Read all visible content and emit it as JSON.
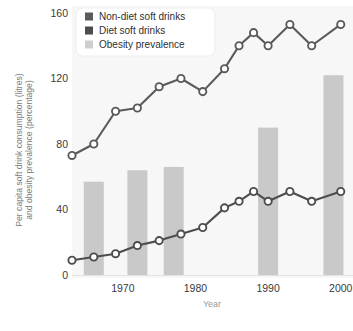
{
  "chart_data": {
    "type": "line",
    "title": "",
    "xlabel": "Year",
    "ylabel": "Per capita soft drink consumption (litres) and obesity prevalence (percentage)",
    "ylabel_line1": "Per capita soft drink consumption (litres)",
    "ylabel_line2": "and obesity prevalence (percentage)",
    "xlim": [
      1963,
      2001
    ],
    "ylim": [
      0,
      160
    ],
    "yticks": [
      0,
      40,
      80,
      120,
      160
    ],
    "ytick_labels": [
      "0",
      "40",
      "80",
      "120",
      "160"
    ],
    "xticks": [
      1970,
      1980,
      1990,
      2000
    ],
    "xtick_labels": [
      "1970",
      "1980",
      "1990",
      "2000"
    ],
    "grid": false,
    "legend_position": "top-left",
    "legend": [
      {
        "label": "Non-diet soft drinks",
        "color": "#5a5a5a",
        "marker": "square"
      },
      {
        "label": "Diet soft drinks",
        "color": "#4d4d4d",
        "marker": "square"
      },
      {
        "label": "Obesity prevalence",
        "color": "#cfcfcf",
        "marker": "square"
      }
    ],
    "series": [
      {
        "name": "Non-diet soft drinks",
        "type": "line",
        "color": "#5a5a5a",
        "marker": "circle-open",
        "x": [
          1963,
          1966,
          1969,
          1972,
          1975,
          1978,
          1981,
          1984,
          1986,
          1988,
          1990,
          1993,
          1996,
          2000
        ],
        "values": [
          73,
          80,
          100,
          102,
          115,
          120,
          112,
          126,
          140,
          148,
          140,
          153,
          140,
          153
        ],
        "y": [
          73,
          80,
          100,
          102,
          115,
          120,
          112,
          126,
          140,
          148,
          140,
          153,
          140,
          153
        ]
      },
      {
        "name": "Diet soft drinks",
        "type": "line",
        "color": "#4d4d4d",
        "marker": "circle-open",
        "x": [
          1963,
          1966,
          1969,
          1972,
          1975,
          1978,
          1981,
          1984,
          1986,
          1988,
          1990,
          1993,
          1996,
          2000
        ],
        "values": [
          9,
          11,
          13,
          18,
          21,
          25,
          29,
          41,
          45,
          51,
          45,
          51,
          45,
          51
        ],
        "y": [
          9,
          11,
          13,
          18,
          21,
          25,
          29,
          41,
          45,
          51,
          45,
          51,
          45,
          51
        ]
      },
      {
        "name": "Obesity prevalence",
        "type": "bar",
        "color": "#c9c9c9",
        "x": [
          1966,
          1972,
          1977,
          1990,
          1999
        ],
        "values": [
          57,
          64,
          66,
          90,
          122
        ],
        "y": [
          57,
          64,
          66,
          90,
          122
        ]
      }
    ]
  },
  "legend_box": {
    "items": [
      {
        "label": "Non-diet soft drinks"
      },
      {
        "label": "Diet soft drinks"
      },
      {
        "label": "Obesity prevalence"
      }
    ]
  },
  "axes": {
    "y_title_line1": "Per capita soft drink consumption (litres)",
    "y_title_line2": "and obesity prevalence (percentage)",
    "x_title": "Year",
    "y_labels": [
      "160",
      "120",
      "80",
      "40",
      "0"
    ],
    "x_labels": [
      "1970",
      "1980",
      "1990",
      "2000"
    ]
  },
  "colors": {
    "bar": "#c9c9c9",
    "line": "#585858",
    "marker_fill": "#ffffff",
    "plot_bg": "#f7f7f7",
    "page_bg": "#ffffff",
    "axis_text": "#3a3a3a",
    "axis_title": "#9a9a9a",
    "ytitle": "#7d7d7d"
  }
}
